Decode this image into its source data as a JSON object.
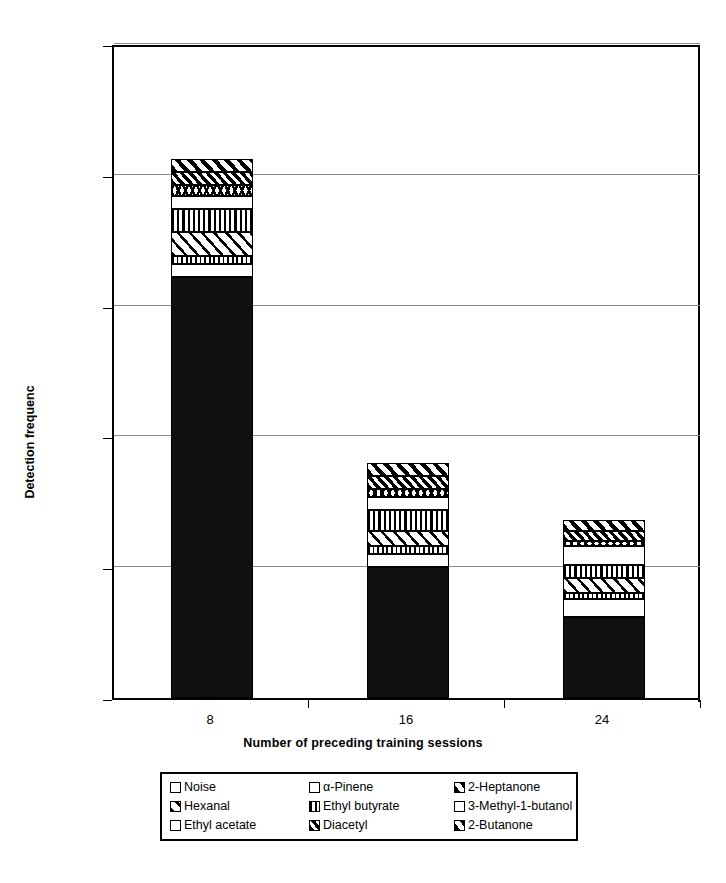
{
  "chart_data": {
    "type": "bar",
    "subtype": "stacked-vertical",
    "title": "",
    "xlabel": "Number of preceding training sessions",
    "ylabel": "Detection frequenc",
    "categories": [
      "8",
      "16",
      "24"
    ],
    "ylim": [
      0,
      250
    ],
    "yticks": [
      0,
      50,
      100,
      150,
      200,
      250
    ],
    "grid": "horizontal",
    "legend_position": "bottom",
    "series": [
      {
        "name": "Noise",
        "pattern": "solid-black",
        "values": [
          161,
          50,
          31
        ]
      },
      {
        "name": "Ethyl acetate",
        "pattern": "blank-white",
        "values": [
          5,
          5,
          7
        ]
      },
      {
        "name": "2-Butanone",
        "pattern": "small-checks",
        "values": [
          3,
          3,
          2
        ]
      },
      {
        "name": "Hexanal",
        "pattern": "diagonal-wide",
        "values": [
          9,
          6,
          6
        ]
      },
      {
        "name": "Ethyl butyrate",
        "pattern": "vertical-lines",
        "values": [
          9,
          8,
          5
        ]
      },
      {
        "name": "α-Pinene",
        "pattern": "blank-white",
        "values": [
          5,
          5,
          7
        ]
      },
      {
        "name": "3-Methyl-1-butanol",
        "pattern": "scalloped",
        "values": [
          4,
          3,
          2
        ]
      },
      {
        "name": "Diacetyl",
        "pattern": "diagonal-dense",
        "values": [
          5,
          5,
          4
        ]
      },
      {
        "name": "2-Heptanone",
        "pattern": "diagonal-thick",
        "values": [
          5,
          5,
          4
        ]
      }
    ],
    "totals": [
      201,
      90,
      68
    ]
  },
  "axes": {
    "y_title": "Detection frequenc",
    "x_title": "Number of preceding training sessions",
    "y_tick_labels": [
      "250",
      "200",
      "150",
      "100",
      "50",
      "0"
    ],
    "x_tick_labels": [
      "8",
      "16",
      "24"
    ]
  },
  "legend": {
    "entries": [
      {
        "label": "Noise",
        "pattern": "solid-black"
      },
      {
        "label": "α-Pinene",
        "pattern": "blank-white"
      },
      {
        "label": "2-Heptanone",
        "pattern": "diagonal-thick"
      },
      {
        "label": "Hexanal",
        "pattern": "diagonal-wide"
      },
      {
        "label": "Ethyl butyrate",
        "pattern": "vertical-lines"
      },
      {
        "label": "3-Methyl-1-butanol",
        "pattern": "blank-white"
      },
      {
        "label": "Ethyl acetate",
        "pattern": "blank-white"
      },
      {
        "label": "Diacetyl",
        "pattern": "diagonal-dense"
      },
      {
        "label": "2-Butanone",
        "pattern": "diagonal-thick"
      }
    ]
  },
  "colors": {
    "ink": "#000000",
    "paper": "#ffffff",
    "gridline": "#8c8c8c"
  }
}
